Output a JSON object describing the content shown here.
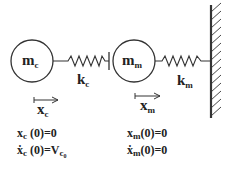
{
  "diagram": {
    "type": "mass-spring system",
    "colors": {
      "stroke": "#333333",
      "text": "#222222",
      "background": "#ffffff"
    },
    "masses": [
      {
        "id": "c",
        "label_main": "m",
        "label_sub": "c"
      },
      {
        "id": "m",
        "label_main": "m",
        "label_sub": "m"
      }
    ],
    "springs": [
      {
        "id": "c",
        "label_main": "k",
        "label_sub": "c"
      },
      {
        "id": "m",
        "label_main": "k",
        "label_sub": "m"
      }
    ],
    "wall": {
      "label": "fixed-wall"
    },
    "displacements": [
      {
        "id": "c",
        "label_main": "x",
        "label_sub": "c"
      },
      {
        "id": "m",
        "label_main": "x",
        "label_sub": "m"
      }
    ],
    "initial_conditions": {
      "c": {
        "position": {
          "var": "x",
          "sub": "c",
          "rest": " (0)=0"
        },
        "velocity": {
          "var": "ẋ",
          "sub": "c",
          "rest": " (0)=V",
          "rest_sub": "c",
          "rest_subsub": "0"
        }
      },
      "m": {
        "position": {
          "var": "x",
          "sub": "m",
          "rest": "(0)=0"
        },
        "velocity": {
          "var": "ẋ",
          "sub": "m",
          "rest": "(0)=0"
        }
      }
    }
  }
}
